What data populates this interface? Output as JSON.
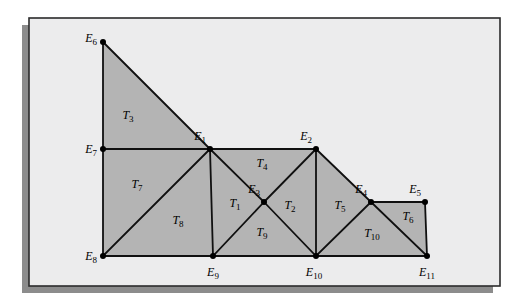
{
  "figure": {
    "canvas": {
      "width": 516,
      "height": 305
    },
    "frame": {
      "x": 29,
      "y": 18,
      "width": 471,
      "height": 268,
      "border_color": "#2b2b2b",
      "fill_color": "#ececed",
      "shadow_color": "#8c8c8c",
      "shadow_offset": 7
    },
    "style": {
      "shaded_fill": "#b4b4b4",
      "edge_color": "#101010",
      "edge_width": 1.8,
      "vertex_color": "#000000",
      "vertex_radius": 3.0,
      "label_color": "#000000",
      "label_font_size": 12
    },
    "vertices": [
      {
        "name": "E1",
        "label": "E",
        "sub": "1",
        "x": 210,
        "y": 149,
        "label_x": 206,
        "label_y": 140,
        "label_anchor": "end"
      },
      {
        "name": "E2",
        "label": "E",
        "sub": "2",
        "x": 316,
        "y": 149,
        "label_x": 312,
        "label_y": 140,
        "label_anchor": "end"
      },
      {
        "name": "E3",
        "label": "E",
        "sub": "3",
        "x": 264,
        "y": 202,
        "label_x": 260,
        "label_y": 193,
        "label_anchor": "end"
      },
      {
        "name": "E4",
        "label": "E",
        "sub": "4",
        "x": 371,
        "y": 202,
        "label_x": 367,
        "label_y": 193,
        "label_anchor": "end"
      },
      {
        "name": "E5",
        "label": "E",
        "sub": "5",
        "x": 425,
        "y": 202,
        "label_x": 421,
        "label_y": 193,
        "label_anchor": "end"
      },
      {
        "name": "E6",
        "label": "E",
        "sub": "6",
        "x": 103,
        "y": 42,
        "label_x": 97,
        "label_y": 42,
        "label_anchor": "end"
      },
      {
        "name": "E7",
        "label": "E",
        "sub": "7",
        "x": 103,
        "y": 149,
        "label_x": 97,
        "label_y": 153,
        "label_anchor": "end"
      },
      {
        "name": "E8",
        "label": "E",
        "sub": "8",
        "x": 103,
        "y": 256,
        "label_x": 97,
        "label_y": 260,
        "label_anchor": "end"
      },
      {
        "name": "E9",
        "label": "E",
        "sub": "9",
        "x": 213,
        "y": 256,
        "label_x": 213,
        "label_y": 276,
        "label_anchor": "middle"
      },
      {
        "name": "E10",
        "label": "E",
        "sub": "10",
        "x": 316,
        "y": 256,
        "label_x": 314,
        "label_y": 276,
        "label_anchor": "middle"
      },
      {
        "name": "E11",
        "label": "E",
        "sub": "11",
        "x": 427,
        "y": 256,
        "label_x": 427,
        "label_y": 276,
        "label_anchor": "middle"
      }
    ],
    "regions": [
      {
        "name": "T3",
        "points": "103,42 210,149 103,149"
      },
      {
        "name": "T7",
        "points": "103,149 210,149 103,256"
      },
      {
        "name": "T8",
        "points": "103,256 210,149 213,256"
      },
      {
        "name": "T1",
        "points": "213,256 210,149 264,202"
      },
      {
        "name": "T4",
        "points": "210,149 316,149 264,202"
      },
      {
        "name": "T9",
        "points": "213,256 264,202 316,256"
      },
      {
        "name": "T2",
        "points": "264,202 316,149 316,256"
      },
      {
        "name": "T5",
        "points": "316,149 371,202 316,256"
      },
      {
        "name": "T10",
        "points": "316,256 371,202 427,256"
      },
      {
        "name": "T6",
        "points": "371,202 425,202 427,256"
      }
    ],
    "edges": [
      {
        "name": "E6-E7",
        "x1": 103,
        "y1": 42,
        "x2": 103,
        "y2": 149
      },
      {
        "name": "E7-E8",
        "x1": 103,
        "y1": 149,
        "x2": 103,
        "y2": 256
      },
      {
        "name": "E6-E1",
        "x1": 103,
        "y1": 42,
        "x2": 210,
        "y2": 149
      },
      {
        "name": "E7-E1",
        "x1": 103,
        "y1": 149,
        "x2": 210,
        "y2": 149
      },
      {
        "name": "E1-E2",
        "x1": 210,
        "y1": 149,
        "x2": 316,
        "y2": 149
      },
      {
        "name": "E8-E9",
        "x1": 103,
        "y1": 256,
        "x2": 213,
        "y2": 256
      },
      {
        "name": "E9-E10",
        "x1": 213,
        "y1": 256,
        "x2": 316,
        "y2": 256
      },
      {
        "name": "E10-E11",
        "x1": 316,
        "y1": 256,
        "x2": 427,
        "y2": 256
      },
      {
        "name": "E8-E1",
        "x1": 103,
        "y1": 256,
        "x2": 210,
        "y2": 149
      },
      {
        "name": "E1-E9",
        "x1": 210,
        "y1": 149,
        "x2": 213,
        "y2": 256
      },
      {
        "name": "E1-E3",
        "x1": 210,
        "y1": 149,
        "x2": 264,
        "y2": 202
      },
      {
        "name": "E9-E3",
        "x1": 213,
        "y1": 256,
        "x2": 264,
        "y2": 202
      },
      {
        "name": "E3-E2",
        "x1": 264,
        "y1": 202,
        "x2": 316,
        "y2": 149
      },
      {
        "name": "E3-E10",
        "x1": 264,
        "y1": 202,
        "x2": 316,
        "y2": 256
      },
      {
        "name": "E2-E10",
        "x1": 316,
        "y1": 149,
        "x2": 316,
        "y2": 256
      },
      {
        "name": "E2-E4",
        "x1": 316,
        "y1": 149,
        "x2": 371,
        "y2": 202
      },
      {
        "name": "E4-E10",
        "x1": 371,
        "y1": 202,
        "x2": 316,
        "y2": 256
      },
      {
        "name": "E4-E11",
        "x1": 371,
        "y1": 202,
        "x2": 427,
        "y2": 256
      },
      {
        "name": "E4-E5",
        "x1": 371,
        "y1": 202,
        "x2": 425,
        "y2": 202
      },
      {
        "name": "E5-E11",
        "x1": 425,
        "y1": 202,
        "x2": 427,
        "y2": 256
      }
    ],
    "region_labels": [
      {
        "name": "T1",
        "label": "T",
        "sub": "1",
        "x": 235,
        "y": 207
      },
      {
        "name": "T2",
        "label": "T",
        "sub": "2",
        "x": 290,
        "y": 209
      },
      {
        "name": "T3",
        "label": "T",
        "sub": "3",
        "x": 128,
        "y": 119
      },
      {
        "name": "T4",
        "label": "T",
        "sub": "4",
        "x": 262,
        "y": 167
      },
      {
        "name": "T5",
        "label": "T",
        "sub": "5",
        "x": 340,
        "y": 209
      },
      {
        "name": "T6",
        "label": "T",
        "sub": "6",
        "x": 408,
        "y": 220
      },
      {
        "name": "T7",
        "label": "T",
        "sub": "7",
        "x": 137,
        "y": 188
      },
      {
        "name": "T8",
        "label": "T",
        "sub": "8",
        "x": 178,
        "y": 224
      },
      {
        "name": "T9",
        "label": "T",
        "sub": "9",
        "x": 262,
        "y": 236
      },
      {
        "name": "T10",
        "label": "T",
        "sub": "10",
        "x": 372,
        "y": 237
      }
    ]
  }
}
